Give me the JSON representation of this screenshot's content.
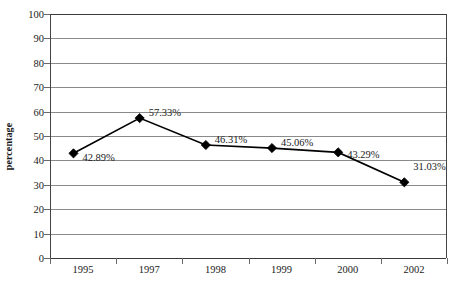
{
  "chart_data": {
    "type": "line",
    "title": "",
    "xlabel": "",
    "ylabel": "percentage",
    "categories": [
      "1995",
      "1997",
      "1998",
      "1999",
      "2000",
      "2002"
    ],
    "values": [
      42.89,
      57.33,
      46.31,
      45.06,
      43.29,
      31.03
    ],
    "point_labels": [
      "42.89%",
      "57.33%",
      "46.31%",
      "45.06%",
      "43.29%",
      "31.03%"
    ],
    "ylim": [
      0,
      100
    ],
    "ytick_step": 10,
    "ytick_labels": [
      "100",
      "90",
      "80",
      "70",
      "60",
      "50",
      "40",
      "30",
      "20",
      "10",
      "0"
    ],
    "grid": true,
    "legend": "none",
    "marker": "diamond",
    "series_color": "#000000",
    "grid_color": "#8a8a8a",
    "axis_color": "#3a3a3a",
    "text_color": "#1a1a1a"
  },
  "axes": {
    "y_title": "percentage"
  }
}
